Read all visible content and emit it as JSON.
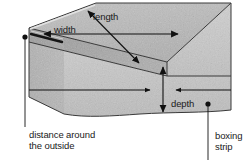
{
  "figure": {
    "kind": "line-drawing",
    "shape": "rectangular-box",
    "background": "#ffffff",
    "ink_color": "#111111",
    "faces": {
      "top_fill": "#b9b9b9",
      "front_fill": "#c4c4c4",
      "left_fill": "#a0a0a0",
      "edge_highlight": "#d6d6d6"
    }
  },
  "labels": {
    "length": "length",
    "width": "width",
    "depth": "depth",
    "distance_around": "distance around\nthe outside",
    "boxing_strip": "boxing\nstrip"
  },
  "annotations": [
    {
      "name": "length",
      "text": "length",
      "marker": "double-headed-arrow",
      "orientation": "diagonal",
      "describes": "top face long dimension"
    },
    {
      "name": "width",
      "text": "width",
      "marker": "double-headed-arrow",
      "orientation": "horizontal",
      "describes": "top face short dimension"
    },
    {
      "name": "depth",
      "text": "depth",
      "marker": "double-headed-arrow",
      "orientation": "vertical",
      "describes": "front face height"
    },
    {
      "name": "distance-around-the-outside",
      "text": "distance around the outside",
      "marker": "leader-line-with-dot",
      "orientation": "vertical",
      "describes": "perimeter edge of box"
    },
    {
      "name": "boxing-strip",
      "text": "boxing strip",
      "marker": "leader-line-with-dot",
      "orientation": "vertical",
      "describes": "front side band of box"
    }
  ]
}
